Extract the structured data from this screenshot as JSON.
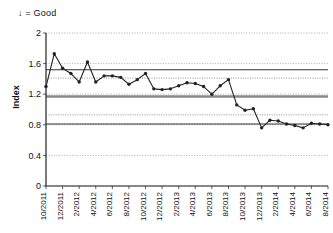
{
  "chart_data": {
    "type": "line",
    "title": "",
    "annotation": "↓ = Good",
    "xlabel": "",
    "ylabel": "Index",
    "ylim": [
      0,
      2
    ],
    "yticks": [
      0,
      0.4,
      0.8,
      1.2,
      1.6,
      2
    ],
    "ytick_labels": [
      "0",
      "0.4",
      "0.8",
      "1.2",
      "1.6",
      "2"
    ],
    "grid": true,
    "legend": "none",
    "x": [
      "10/2011",
      "11/2011",
      "12/2011",
      "1/2012",
      "2/2012",
      "3/2012",
      "4/2012",
      "5/2012",
      "6/2012",
      "7/2012",
      "8/2012",
      "9/2012",
      "10/2012",
      "11/2012",
      "12/2012",
      "1/2013",
      "2/2013",
      "3/2013",
      "4/2013",
      "5/2013",
      "6/2013",
      "7/2013",
      "8/2013",
      "9/2013",
      "10/2013",
      "11/2013",
      "12/2013",
      "1/2014",
      "2/2014",
      "3/2014",
      "4/2014",
      "5/2014",
      "6/2014",
      "7/2014",
      "8/2014"
    ],
    "xtick_labels": [
      "10/2011",
      "12/2011",
      "2/2012",
      "4/2012",
      "6/2012",
      "8/2012",
      "10/2012",
      "12/2012",
      "2/2013",
      "4/2013",
      "6/2013",
      "8/2013",
      "10/2013",
      "12/2013",
      "2/2014",
      "4/2014",
      "6/2014",
      "8/2014"
    ],
    "series": [
      {
        "name": "Index",
        "style": "line-markers",
        "color": "#222222",
        "values": [
          1.3,
          1.73,
          1.54,
          1.47,
          1.36,
          1.62,
          1.36,
          1.44,
          1.44,
          1.42,
          1.33,
          1.39,
          1.47,
          1.27,
          1.26,
          1.27,
          1.31,
          1.35,
          1.34,
          1.3,
          1.2,
          1.31,
          1.39,
          1.06,
          0.99,
          1.01,
          0.76,
          0.86,
          0.85,
          0.81,
          0.79,
          0.76,
          0.82,
          0.81,
          0.8
        ]
      },
      {
        "name": "Index continued",
        "style": "line-markers",
        "color": "#222222",
        "values_tail": [
          0.8,
          1.39,
          0.81,
          0.92,
          1.0,
          1.02,
          0.82,
          0.69,
          0.8,
          0.8,
          0.8
        ]
      },
      {
        "name": "Upper control limit",
        "style": "solid",
        "color": "#333333",
        "level": 1.52
      },
      {
        "name": "Center line",
        "style": "thick-gray",
        "color": "#8a8a8a",
        "level": 1.17
      },
      {
        "name": "Lower control limit",
        "style": "solid",
        "color": "#333333",
        "level": 0.81
      },
      {
        "name": "Upper sigma band",
        "style": "dotted",
        "color": "#777777",
        "level": 1.41
      },
      {
        "name": "Lower sigma band",
        "style": "dotted",
        "color": "#777777",
        "level": 0.93
      }
    ]
  },
  "axes": {
    "y_title": "Index",
    "annotation": "↓ = Good"
  }
}
